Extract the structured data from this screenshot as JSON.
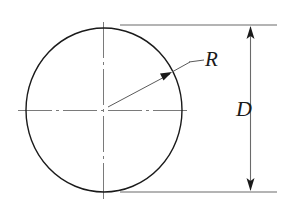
{
  "diagram": {
    "type": "engineering-dimension-drawing",
    "background_color": "#ffffff",
    "labels": {
      "radius": "R",
      "diameter": "D"
    },
    "colors": {
      "outline": "#1a1a1a",
      "centerline": "#7a7a7a",
      "dimension_line": "#6a6a6a",
      "extension_line": "#6a6a6a",
      "leader_line": "#5a5a5a",
      "text": "#1a1a1a"
    },
    "geometry": {
      "circle": {
        "center_x": 104,
        "center_y": 110,
        "radius_x": 78,
        "radius_y": 82,
        "stroke_width": 1.4
      },
      "center_mark": {
        "horizontal_from_x": 18,
        "horizontal_to_x": 190,
        "vertical_from_y": 22,
        "vertical_to_y": 200,
        "dash_pattern": "14 4 3 4"
      },
      "radius_leader": {
        "arrow_tip_x": 172,
        "arrow_tip_y": 72,
        "elbow_x": 190,
        "elbow_y": 62,
        "shelf_end_x": 204,
        "start_x": 104,
        "start_y": 110
      },
      "diameter_dimension": {
        "line_x": 250,
        "top_y": 25,
        "bottom_y": 192,
        "extension_from_x": 120,
        "extension_to_x": 277,
        "arrow_head_length": 12,
        "arrow_head_half_width": 4
      }
    }
  }
}
